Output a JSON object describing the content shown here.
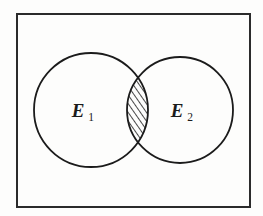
{
  "figure": {
    "background_color": "#fdfdfc",
    "ink_color": "#1b1b1b"
  },
  "frame": {
    "name": "sample-space-rectangle",
    "x": 17,
    "y": 14,
    "width": 233,
    "height": 193,
    "stroke_color": "#2b2b2b",
    "stroke_width": 2,
    "fill": "none"
  },
  "sets": [
    {
      "id": "E1",
      "label": "E",
      "subscript": "1",
      "cx": 91,
      "cy": 110,
      "r": 57,
      "label_x": 78,
      "label_y": 117,
      "sub_x": 91,
      "sub_y": 121,
      "stroke_color": "#1b1b1b",
      "stroke_width": 1.8,
      "fill": "none"
    },
    {
      "id": "E2",
      "label": "E",
      "subscript": "2",
      "cx": 180,
      "cy": 110,
      "r": 53,
      "label_x": 177,
      "label_y": 117,
      "sub_x": 190,
      "sub_y": 121,
      "stroke_color": "#1b1b1b",
      "stroke_width": 1.8,
      "fill": "none"
    }
  ],
  "intersection": {
    "name": "intersection-lens",
    "description": "hatched lens-shaped overlap of E1 and E2",
    "top_x": 138,
    "top_y": 76,
    "bottom_x": 138,
    "bottom_y": 145,
    "left_bulge_x": 128,
    "right_bulge_x": 148,
    "center_y": 110,
    "hatch": {
      "name": "diagonal-hatch-pattern",
      "direction": "lower-left-to-upper-right",
      "angle_deg": 35,
      "spacing_px": 5,
      "line_width": 1.6,
      "color": "#1b1b1b"
    },
    "outline_color": "#1b1b1b",
    "outline_width": 1.8
  }
}
